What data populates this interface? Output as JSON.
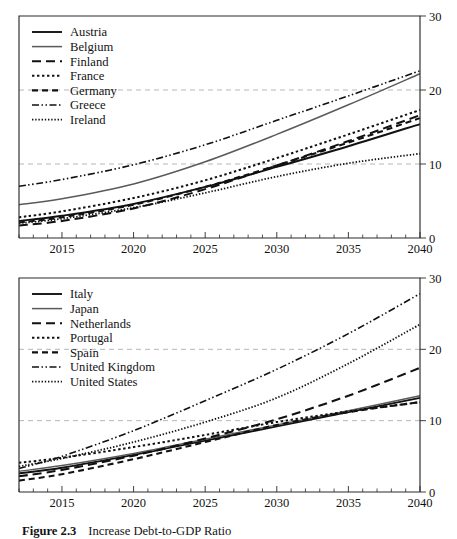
{
  "figure": {
    "caption_label": "Figure 2.3",
    "caption_title": "Increase Debt-to-GDP Ratio"
  },
  "chart_data": [
    {
      "type": "line",
      "panel": "top",
      "title": "",
      "xlabel": "",
      "ylabel": "",
      "xlim": [
        2012,
        2040
      ],
      "ylim": [
        0,
        30
      ],
      "xticks": [
        2015,
        2020,
        2025,
        2030,
        2035,
        2040
      ],
      "xtick_labels": [
        "2015",
        "2020",
        "2025",
        "2030",
        "2035",
        "2040"
      ],
      "yticks": [
        0,
        10,
        20,
        30
      ],
      "ytick_labels": [
        "0",
        "10",
        "20",
        "30"
      ],
      "y_axis_position": "right",
      "gridlines": [
        10,
        20
      ],
      "grid": true,
      "legend_position": "top-left",
      "minor_tick_step": 1,
      "x": [
        2012,
        2015,
        2020,
        2025,
        2030,
        2035,
        2040
      ],
      "series": [
        {
          "name": "Austria",
          "style": "solid",
          "color": "#111111",
          "width": 1.9,
          "dash": "",
          "values": [
            2.3,
            3.0,
            4.6,
            6.9,
            9.6,
            12.4,
            15.4
          ]
        },
        {
          "name": "Belgium",
          "style": "solid",
          "color": "#5a5a5a",
          "width": 1.5,
          "dash": "",
          "values": [
            4.5,
            5.3,
            7.3,
            10.3,
            14.0,
            18.0,
            22.2
          ]
        },
        {
          "name": "Finland",
          "style": "long-dash",
          "color": "#111111",
          "width": 2.0,
          "dash": "9 5",
          "values": [
            1.7,
            2.3,
            4.0,
            6.6,
            9.8,
            13.1,
            16.6
          ]
        },
        {
          "name": "France",
          "style": "dotted-square",
          "color": "#111111",
          "width": 2.0,
          "dash": "2.4 2.6",
          "values": [
            2.8,
            3.6,
            5.4,
            7.8,
            10.8,
            14.0,
            17.3
          ]
        },
        {
          "name": "Germany",
          "style": "dash",
          "color": "#111111",
          "width": 2.1,
          "dash": "6 4",
          "values": [
            2.1,
            2.8,
            4.5,
            6.9,
            9.8,
            12.9,
            16.2
          ]
        },
        {
          "name": "Greece",
          "style": "dash-dot-dot",
          "color": "#111111",
          "width": 1.6,
          "dash": "7 2.5 1.5 2.5 1.5 2.5",
          "values": [
            7.0,
            7.9,
            9.9,
            12.6,
            15.9,
            19.2,
            22.6
          ]
        },
        {
          "name": "Ireland",
          "style": "fine-dot",
          "color": "#111111",
          "width": 1.8,
          "dash": "1.4 1.8",
          "values": [
            2.0,
            2.6,
            4.1,
            6.1,
            8.3,
            10.1,
            11.4
          ]
        }
      ]
    },
    {
      "type": "line",
      "panel": "bottom",
      "title": "",
      "xlabel": "",
      "ylabel": "",
      "xlim": [
        2012,
        2040
      ],
      "ylim": [
        0,
        30
      ],
      "xticks": [
        2015,
        2020,
        2025,
        2030,
        2035,
        2040
      ],
      "xtick_labels": [
        "2015",
        "2020",
        "2025",
        "2030",
        "2035",
        "2040"
      ],
      "yticks": [
        0,
        10,
        20,
        30
      ],
      "ytick_labels": [
        "0",
        "10",
        "20",
        "30"
      ],
      "y_axis_position": "right",
      "gridlines": [
        10,
        20
      ],
      "grid": true,
      "legend_position": "top-left",
      "minor_tick_step": 1,
      "x": [
        2012,
        2015,
        2020,
        2025,
        2030,
        2035,
        2040
      ],
      "series": [
        {
          "name": "Italy",
          "style": "solid",
          "color": "#111111",
          "width": 1.9,
          "dash": "",
          "values": [
            2.6,
            3.4,
            5.2,
            7.2,
            9.2,
            11.2,
            13.2
          ]
        },
        {
          "name": "Japan",
          "style": "solid",
          "color": "#5a5a5a",
          "width": 1.5,
          "dash": "",
          "values": [
            2.9,
            3.7,
            5.4,
            7.4,
            9.4,
            11.4,
            13.5
          ]
        },
        {
          "name": "Netherlands",
          "style": "long-dash",
          "color": "#111111",
          "width": 2.1,
          "dash": "9 5",
          "values": [
            2.2,
            3.1,
            5.1,
            7.5,
            10.2,
            13.5,
            17.4
          ]
        },
        {
          "name": "Portugal",
          "style": "dotted-square",
          "color": "#111111",
          "width": 2.0,
          "dash": "2.4 2.6",
          "values": [
            4.1,
            4.8,
            6.3,
            8.0,
            9.8,
            11.3,
            12.6
          ]
        },
        {
          "name": "Spain",
          "style": "dash",
          "color": "#111111",
          "width": 2.1,
          "dash": "6 4",
          "values": [
            1.6,
            2.5,
            4.6,
            7.0,
            9.4,
            11.2,
            12.6
          ]
        },
        {
          "name": "United Kingdom",
          "style": "dash-dot-dot",
          "color": "#111111",
          "width": 1.6,
          "dash": "7 2.5 1.5 2.5 1.5 2.5",
          "values": [
            3.3,
            5.0,
            8.6,
            12.8,
            17.2,
            22.2,
            27.8
          ]
        },
        {
          "name": "United States",
          "style": "fine-dot",
          "color": "#111111",
          "width": 1.8,
          "dash": "1.4 1.8",
          "values": [
            3.6,
            4.7,
            7.0,
            9.8,
            13.2,
            18.0,
            23.5
          ]
        }
      ]
    }
  ]
}
